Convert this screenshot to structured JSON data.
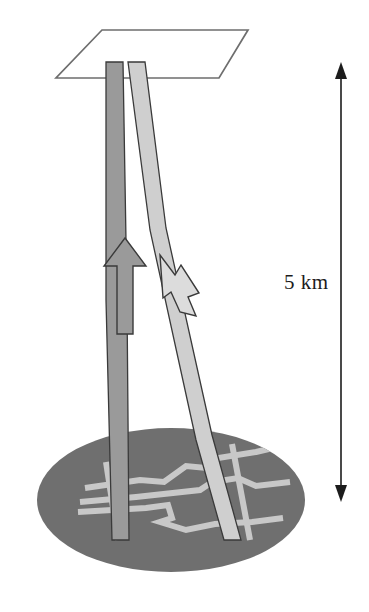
{
  "figure": {
    "scale_bar": {
      "label": "5 km",
      "label_x": 284,
      "label_y": 270,
      "arrow_x": 341,
      "arrow_top_y": 62,
      "arrow_bottom_y": 502,
      "color": "#1c1c1c",
      "name": "vertical-scale-bar"
    },
    "plane": {
      "name": "surface-plane",
      "points": "102,30 248,30 219,78 56,78",
      "stroke": "#6e6e6e",
      "fill": "#ffffff",
      "stroke_width": 1.7
    },
    "ellipse": {
      "name": "reservoir-ellipse",
      "cx": 171,
      "cy": 500,
      "rx": 134,
      "ry": 72,
      "fill": "#6f6f6f"
    },
    "conduits": [
      {
        "name": "ascending-conduit",
        "fill": "#9a9a9a",
        "stroke": "#3a3a3a",
        "path": "M 106,62 L 106,300 L 112,540 L 129,540 L 127,300 L 123,62 Z"
      },
      {
        "name": "descending-conduit",
        "fill": "#cfcfcf",
        "stroke": "#3a3a3a",
        "path": "M 128,62 L 150,230 L 196,440 L 224,540 L 241,540 L 212,435 L 166,228 L 145,62 Z"
      }
    ],
    "arrows": [
      {
        "name": "upward-flow-arrow",
        "direction": "up",
        "fill": "#9a9a9a",
        "stroke": "#3a3a3a",
        "path": "M 125,238 L 146,266 L 133,266 L 133,334 L 117,334 L 117,266 L 104,266 Z"
      },
      {
        "name": "downward-flow-arrow",
        "direction": "down",
        "fill": "#dcdcdc",
        "stroke": "#3a3a3a",
        "path": "M 160,255 L 175,275 L 181,265 L 199,293 L 188,297 L 196,316 L 180,312 L 171,292 L 163,298 Z"
      }
    ],
    "fractures": {
      "name": "fracture-network",
      "stroke": "#c8c8c8",
      "stroke_width": 6,
      "lines": [
        "M 85,488 L 140,480 L 164,482 L 186,466 L 206,468 L 218,458 L 256,452 L 290,444",
        "M 80,502 L 136,497 L 200,490 L 212,482 L 238,478 L 256,486 L 290,482",
        "M 78,512 L 146,508 L 168,505 L 172,518 L 160,522 L 186,530 L 215,524 L 252,522 L 283,518",
        "M 106,462 L 118,540",
        "M 232,444 L 250,540"
      ]
    }
  }
}
